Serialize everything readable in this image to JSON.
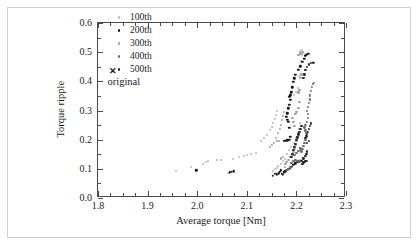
{
  "chart_data": {
    "type": "scatter",
    "title": "",
    "xlabel": "Average torque [Nm]",
    "ylabel": "Torque ripple",
    "xlim": [
      1.8,
      2.3
    ],
    "ylim": [
      0.0,
      0.6
    ],
    "xticks": [
      "1.8",
      "1.9",
      "2.0",
      "2.1",
      "2.2",
      "2.3"
    ],
    "xtick_values": [
      1.8,
      1.9,
      2.0,
      2.1,
      2.2,
      2.3
    ],
    "yticks": [
      "0.0",
      "0.1",
      "0.2",
      "0.3",
      "0.4",
      "0.5",
      "0.6"
    ],
    "ytick_values": [
      0.0,
      0.1,
      0.2,
      0.3,
      0.4,
      0.5,
      0.6
    ],
    "x_minor_step": 0.025,
    "y_minor_step": 0.05,
    "grid": false,
    "legend_position": "upper-center",
    "annotations": [
      {
        "name": "original",
        "label": "original",
        "marker": "x",
        "x": 1.832,
        "y": 0.432,
        "color": "#1a1a1a"
      }
    ],
    "series": [
      {
        "name": "100th",
        "label": "100th",
        "color": "#b8b8b8",
        "marker": "circle",
        "size": 2.0,
        "points": [
          [
            1.958,
            0.094
          ],
          [
            1.988,
            0.107
          ],
          [
            2.012,
            0.118
          ],
          [
            2.018,
            0.123
          ],
          [
            2.022,
            0.127
          ],
          [
            2.04,
            0.13
          ],
          [
            2.048,
            0.13
          ],
          [
            2.062,
            0.086
          ],
          [
            2.072,
            0.134
          ],
          [
            2.085,
            0.141
          ],
          [
            2.094,
            0.143
          ],
          [
            2.1,
            0.147
          ],
          [
            2.108,
            0.152
          ],
          [
            2.118,
            0.153
          ],
          [
            2.128,
            0.196
          ],
          [
            2.134,
            0.205
          ],
          [
            2.14,
            0.216
          ],
          [
            2.146,
            0.232
          ],
          [
            2.15,
            0.244
          ],
          [
            2.152,
            0.258
          ],
          [
            2.156,
            0.272
          ],
          [
            2.158,
            0.286
          ],
          [
            2.16,
            0.3
          ],
          [
            2.152,
            0.092
          ],
          [
            2.156,
            0.098
          ],
          [
            2.16,
            0.104
          ],
          [
            2.162,
            0.11
          ],
          [
            2.168,
            0.118
          ],
          [
            2.172,
            0.126
          ],
          [
            2.176,
            0.133
          ],
          [
            2.182,
            0.15
          ],
          [
            2.186,
            0.163
          ],
          [
            2.19,
            0.176
          ],
          [
            2.196,
            0.19
          ],
          [
            2.2,
            0.205
          ],
          [
            2.204,
            0.222
          ],
          [
            2.206,
            0.238
          ],
          [
            2.208,
            0.256
          ],
          [
            2.2,
            0.365
          ],
          [
            2.196,
            0.352
          ],
          [
            2.204,
            0.377
          ],
          [
            2.206,
            0.42
          ],
          [
            2.21,
            0.47
          ],
          [
            2.212,
            0.49
          ],
          [
            2.214,
            0.498
          ],
          [
            2.208,
            0.504
          ],
          [
            2.211,
            0.508
          ]
        ]
      },
      {
        "name": "200th",
        "label": "200th",
        "color": "#1a1a1a",
        "marker": "circle",
        "size": 2.4,
        "points": [
          [
            1.998,
            0.095
          ],
          [
            2.066,
            0.088
          ],
          [
            2.07,
            0.09
          ],
          [
            2.074,
            0.092
          ],
          [
            2.152,
            0.077
          ],
          [
            2.156,
            0.083
          ],
          [
            2.16,
            0.081
          ],
          [
            2.164,
            0.085
          ],
          [
            2.166,
            0.09
          ],
          [
            2.168,
            0.095
          ],
          [
            2.17,
            0.084
          ],
          [
            2.172,
            0.079
          ],
          [
            2.174,
            0.088
          ],
          [
            2.178,
            0.092
          ],
          [
            2.182,
            0.097
          ],
          [
            2.186,
            0.101
          ],
          [
            2.19,
            0.108
          ],
          [
            2.194,
            0.113
          ],
          [
            2.198,
            0.119
          ],
          [
            2.202,
            0.124
          ],
          [
            2.206,
            0.126
          ],
          [
            2.21,
            0.128
          ],
          [
            2.174,
            0.196
          ],
          [
            2.178,
            0.197
          ],
          [
            2.182,
            0.198
          ],
          [
            2.186,
            0.199
          ],
          [
            2.188,
            0.21
          ],
          [
            2.186,
            0.24
          ],
          [
            2.184,
            0.262
          ],
          [
            2.182,
            0.268
          ],
          [
            2.18,
            0.278
          ],
          [
            2.182,
            0.29
          ],
          [
            2.184,
            0.308
          ],
          [
            2.186,
            0.32
          ],
          [
            2.188,
            0.336
          ],
          [
            2.186,
            0.346
          ],
          [
            2.188,
            0.352
          ],
          [
            2.19,
            0.362
          ],
          [
            2.192,
            0.38
          ],
          [
            2.194,
            0.398
          ],
          [
            2.196,
            0.41
          ],
          [
            2.198,
            0.422
          ],
          [
            2.204,
            0.44
          ],
          [
            2.208,
            0.452
          ],
          [
            2.212,
            0.468
          ],
          [
            2.216,
            0.478
          ],
          [
            2.218,
            0.488
          ],
          [
            2.22,
            0.492
          ],
          [
            2.224,
            0.494
          ],
          [
            2.234,
            0.464
          ]
        ]
      },
      {
        "name": "300th",
        "label": "300th",
        "color": "#a0a0a0",
        "marker": "circle",
        "size": 2.2,
        "points": [
          [
            2.146,
            0.176
          ],
          [
            2.15,
            0.183
          ],
          [
            2.154,
            0.19
          ],
          [
            2.158,
            0.205
          ],
          [
            2.162,
            0.222
          ],
          [
            2.166,
            0.238
          ],
          [
            2.168,
            0.252
          ],
          [
            2.17,
            0.268
          ],
          [
            2.172,
            0.282
          ],
          [
            2.174,
            0.296
          ],
          [
            2.176,
            0.108
          ],
          [
            2.178,
            0.116
          ],
          [
            2.18,
            0.124
          ],
          [
            2.184,
            0.132
          ],
          [
            2.188,
            0.14
          ],
          [
            2.192,
            0.148
          ],
          [
            2.194,
            0.158
          ],
          [
            2.196,
            0.17
          ],
          [
            2.198,
            0.182
          ],
          [
            2.2,
            0.196
          ],
          [
            2.202,
            0.21
          ],
          [
            2.204,
            0.224
          ],
          [
            2.196,
            0.246
          ],
          [
            2.194,
            0.26
          ],
          [
            2.192,
            0.274
          ],
          [
            2.198,
            0.288
          ],
          [
            2.2,
            0.296
          ],
          [
            2.204,
            0.31
          ],
          [
            2.206,
            0.33
          ],
          [
            2.204,
            0.362
          ],
          [
            2.206,
            0.37
          ],
          [
            2.208,
            0.412
          ],
          [
            2.21,
            0.424
          ],
          [
            2.204,
            0.49
          ],
          [
            2.208,
            0.496
          ],
          [
            2.212,
            0.5
          ],
          [
            2.16,
            0.196
          ],
          [
            2.164,
            0.197
          ],
          [
            2.168,
            0.136
          ],
          [
            2.172,
            0.142
          ]
        ]
      },
      {
        "name": "400th",
        "label": "400th",
        "color": "#6e6e6e",
        "marker": "circle",
        "size": 2.2,
        "points": [
          [
            2.196,
            0.148
          ],
          [
            2.2,
            0.156
          ],
          [
            2.204,
            0.162
          ],
          [
            2.208,
            0.17
          ],
          [
            2.21,
            0.16
          ],
          [
            2.212,
            0.168
          ],
          [
            2.214,
            0.178
          ],
          [
            2.216,
            0.19
          ],
          [
            2.218,
            0.2
          ],
          [
            2.22,
            0.21
          ],
          [
            2.22,
            0.222
          ],
          [
            2.218,
            0.232
          ],
          [
            2.216,
            0.242
          ],
          [
            2.218,
            0.252
          ],
          [
            2.222,
            0.262
          ],
          [
            2.224,
            0.274
          ],
          [
            2.224,
            0.288
          ],
          [
            2.222,
            0.3
          ],
          [
            2.224,
            0.312
          ],
          [
            2.226,
            0.326
          ],
          [
            2.228,
            0.338
          ],
          [
            2.228,
            0.352
          ],
          [
            2.23,
            0.366
          ],
          [
            2.232,
            0.38
          ],
          [
            2.234,
            0.392
          ],
          [
            2.236,
            0.396
          ],
          [
            2.19,
            0.12
          ],
          [
            2.194,
            0.126
          ],
          [
            2.198,
            0.13
          ],
          [
            2.202,
            0.128
          ],
          [
            2.206,
            0.126
          ],
          [
            2.188,
            0.106
          ],
          [
            2.184,
            0.1
          ],
          [
            2.18,
            0.096
          ]
        ]
      },
      {
        "name": "500th",
        "label": "500th",
        "color": "#2b2b2b",
        "marker": "circle",
        "size": 2.2,
        "points": [
          [
            2.212,
            0.118
          ],
          [
            2.214,
            0.122
          ],
          [
            2.216,
            0.124
          ],
          [
            2.218,
            0.126
          ],
          [
            2.22,
            0.128
          ],
          [
            2.214,
            0.136
          ],
          [
            2.218,
            0.144
          ],
          [
            2.22,
            0.152
          ],
          [
            2.222,
            0.16
          ],
          [
            2.218,
            0.206
          ],
          [
            2.22,
            0.214
          ],
          [
            2.222,
            0.22
          ],
          [
            2.224,
            0.228
          ],
          [
            2.226,
            0.236
          ],
          [
            2.228,
            0.246
          ],
          [
            2.23,
            0.256
          ],
          [
            2.226,
            0.196
          ],
          [
            2.222,
            0.188
          ],
          [
            2.21,
            0.248
          ],
          [
            2.208,
            0.236
          ],
          [
            2.206,
            0.228
          ],
          [
            2.204,
            0.218
          ],
          [
            2.202,
            0.208
          ],
          [
            2.2,
            0.198
          ],
          [
            2.198,
            0.186
          ],
          [
            2.196,
            0.174
          ],
          [
            2.194,
            0.164
          ],
          [
            2.192,
            0.152
          ],
          [
            2.19,
            0.14
          ],
          [
            2.214,
            0.412
          ],
          [
            2.216,
            0.424
          ],
          [
            2.218,
            0.438
          ],
          [
            2.222,
            0.45
          ],
          [
            2.226,
            0.458
          ],
          [
            2.23,
            0.462
          ]
        ]
      }
    ]
  }
}
